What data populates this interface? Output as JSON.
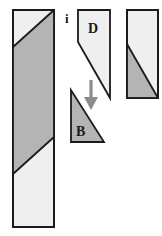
{
  "figure": {
    "type": "geometry-dissection-diagram",
    "background_color": "#ffffff",
    "stroke_color": "#1a1a1a",
    "fill_light": "#efefef",
    "fill_gray": "#b4b4b4",
    "arrow_color": "#8c8c8c",
    "labels": {
      "step_marker": "i",
      "piece_top": "D",
      "piece_bottom": "B"
    },
    "shapes": [
      {
        "name": "left-tall-rectangle",
        "role": "source-strip",
        "outline": "13,10 54,10 54,227 13,227",
        "band_fill": "#b4b4b4",
        "band": "13,47 54,10 54,10 54,137 13,174",
        "note": "tall vertical strip with a wide gray diagonal band crossing it"
      },
      {
        "name": "piece-D-quadrilateral",
        "role": "cut-piece-D",
        "outline": "78,10 110,10 110,98 78,42",
        "fill": "#efefef"
      },
      {
        "name": "piece-B-triangle",
        "role": "cut-piece-B",
        "outline": "71,90 71,142 104,142",
        "fill": "#b4b4b4"
      },
      {
        "name": "right-rectangle",
        "role": "target-rectangle",
        "outline": "127,10 158,10 158,98 127,98",
        "fill_light": "#efefef",
        "diagonal_fill": "#b4b4b4",
        "diagonal": "127,44 158,98 127,98"
      },
      {
        "name": "down-arrow",
        "role": "transform-arrow",
        "direction": "down",
        "color": "#8c8c8c",
        "from": "91,80",
        "to": "91,110"
      }
    ]
  }
}
